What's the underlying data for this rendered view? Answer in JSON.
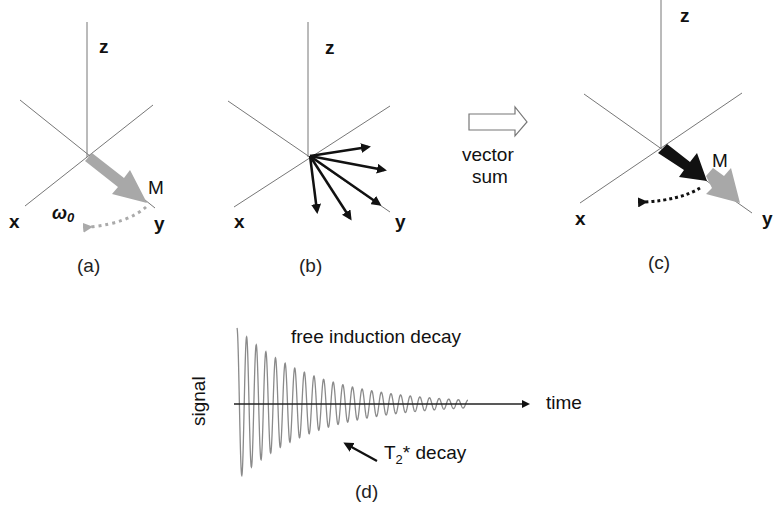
{
  "panels": {
    "a": {
      "caption": "(a)",
      "axis_labels": {
        "z": "z",
        "x": "x",
        "y": "y"
      },
      "vector_label": "M",
      "rotation_label": "ω",
      "rotation_subscript": "0",
      "vector_color": "#a8a8a8"
    },
    "b": {
      "caption": "(b)",
      "axis_labels": {
        "z": "z",
        "x": "x",
        "y": "y"
      },
      "spin_vectors": 5
    },
    "transition": {
      "line1": "vector",
      "line2": "sum"
    },
    "c": {
      "caption": "(c)",
      "axis_labels": {
        "z": "z",
        "x": "x",
        "y": "y"
      },
      "vector_label": "M",
      "net_vector_color": "#111111",
      "original_vector_color": "#a8a8a8"
    },
    "d": {
      "caption": "(d)",
      "title": "free induction decay",
      "xlabel": "time",
      "ylabel": "signal",
      "annotation_main": "T",
      "annotation_sub": "2",
      "annotation_rest": "* decay",
      "signal_color": "#8a8a8a"
    }
  },
  "chart_data": {
    "type": "line",
    "title": "free induction decay",
    "xlabel": "time",
    "ylabel": "signal",
    "annotations": [
      "T2* decay"
    ],
    "cycles": 24,
    "initial_amplitude": 1.0,
    "final_amplitude": 0.05
  }
}
